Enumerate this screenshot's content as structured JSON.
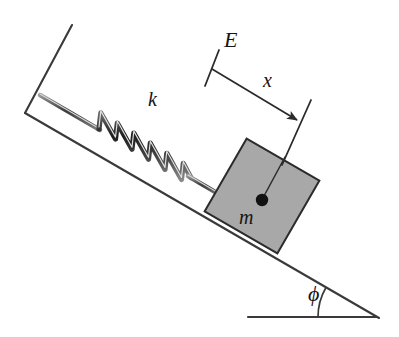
{
  "figure": {
    "background_color": "#ffffff",
    "line_color": "#3a3a3a",
    "ink_color": "#141414",
    "block_fill_color": "#a8a8a8",
    "block_edge_color": "#2b2b2b",
    "spring_color": "#2e2e2e",
    "width": 399,
    "height": 337
  },
  "labels": {
    "spring_constant": "k",
    "equilibrium_point": "E",
    "displacement": "x",
    "mass": "m",
    "incline_angle": "ϕ"
  },
  "geometry": {
    "incline": {
      "top_x": 25,
      "top_y": 113,
      "bottom_x": 379,
      "bottom_y": 318,
      "angle_degrees": 30
    },
    "ground_line": {
      "x1": 248,
      "y1": 317,
      "x2": 377,
      "y2": 317
    },
    "wall": {
      "top_x": 72,
      "top_y": 25,
      "corner_x": 25,
      "corner_y": 113,
      "foot_x": 40,
      "foot_y": 95
    },
    "spring": {
      "start_x": 98,
      "start_y": 128,
      "end_x": 178,
      "end_y": 175,
      "coils": 6,
      "amplitude": 19
    },
    "block": {
      "center_x": 262,
      "center_y": 196,
      "side": 84,
      "rotation_degrees": 30
    },
    "mass_dot": {
      "x": 262,
      "y": 200,
      "radius": 6
    },
    "dimension": {
      "tick_x1": 218,
      "tick_y1": 51,
      "tick_x2": 205,
      "tick_y2": 85,
      "edge_x1": 310,
      "edge_y1": 101,
      "edge_x2": 283,
      "edge_y2": 163,
      "arrow_x1": 212,
      "arrow_y1": 69,
      "arrow_x2": 298,
      "arrow_y2": 121
    },
    "angle_arc": {
      "vertex_x": 376,
      "vertex_y": 317,
      "radius": 58,
      "start_degrees": 180,
      "end_degrees": 150
    }
  }
}
